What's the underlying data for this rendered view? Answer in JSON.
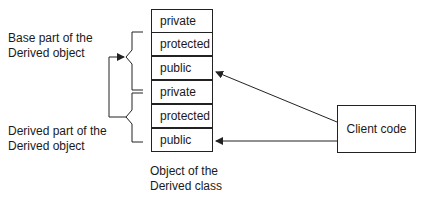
{
  "diagram": {
    "base_label": [
      "Base part of the",
      "Derived object"
    ],
    "derived_label": [
      "Derived part of the",
      "Derived object"
    ],
    "object_label": [
      "Object of the",
      "Derived class"
    ],
    "cells": [
      "private",
      "protected",
      "public",
      "private",
      "protected",
      "public"
    ],
    "client_label": "Client code",
    "colors": {
      "line": "#222222",
      "background": "#ffffff"
    }
  }
}
